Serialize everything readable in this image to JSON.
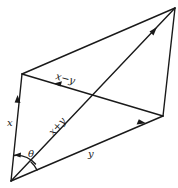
{
  "diagram": {
    "type": "vector-parallelogram",
    "labels": {
      "x": "x",
      "y": "y",
      "sum": "x+y",
      "diff": "x−y",
      "angle": "θ"
    },
    "vertices": {
      "origin": [
        11,
        181
      ],
      "x_tip": [
        22,
        74
      ],
      "y_tip": [
        163,
        116
      ],
      "sum_tip": [
        175,
        8
      ]
    },
    "colors": {
      "stroke": "#1a1a1a",
      "background": "#ffffff"
    }
  }
}
